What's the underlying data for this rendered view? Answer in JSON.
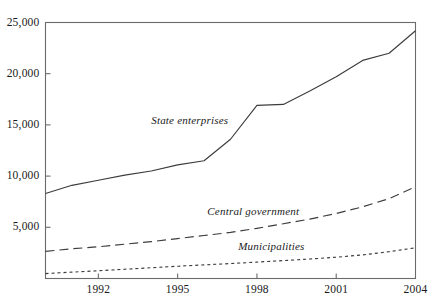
{
  "chart_data": {
    "type": "line",
    "title": "",
    "subtitle": "",
    "xlabel": "",
    "ylabel": "",
    "xlim": [
      1990,
      2004
    ],
    "ylim": [
      0,
      25000
    ],
    "grid": false,
    "legend_position": "inline-annotations",
    "x": [
      1990,
      1991,
      1992,
      1993,
      1994,
      1995,
      1996,
      1997,
      1998,
      1999,
      2000,
      2001,
      2002,
      2003,
      2004
    ],
    "y_ticks": [
      0,
      5000,
      10000,
      15000,
      20000,
      25000
    ],
    "y_tick_labels": [
      "",
      "5,000",
      "10,000",
      "15,000",
      "20,000",
      "25,000"
    ],
    "x_ticks": [
      1992,
      1995,
      1998,
      2001,
      2004
    ],
    "x_tick_labels": [
      "1992",
      "1995",
      "1998",
      "2001",
      "2004"
    ],
    "series": [
      {
        "name": "State enterprises",
        "style": "solid",
        "color": "#3c3c3c",
        "label_x": 1994.0,
        "label_y": 15400,
        "values": [
          8300,
          9100,
          9600,
          10100,
          10500,
          11100,
          11500,
          13600,
          16900,
          17000,
          18300,
          19700,
          21300,
          22000,
          24200
        ]
      },
      {
        "name": "Central government",
        "style": "long-dash",
        "color": "#3c3c3c",
        "label_x": 1999.6,
        "label_y": 6450,
        "values": [
          2650,
          2900,
          3100,
          3350,
          3600,
          3900,
          4200,
          4500,
          4900,
          5350,
          5800,
          6350,
          7000,
          7800,
          8950
        ]
      },
      {
        "name": "Municipalities",
        "style": "short-dash",
        "color": "#3c3c3c",
        "label_x": 1999.8,
        "label_y": 3050,
        "values": [
          480,
          620,
          760,
          900,
          1050,
          1200,
          1330,
          1460,
          1600,
          1750,
          1900,
          2080,
          2300,
          2620,
          3000
        ]
      }
    ]
  },
  "axis": {
    "frame_color": "#6b6b6b"
  }
}
